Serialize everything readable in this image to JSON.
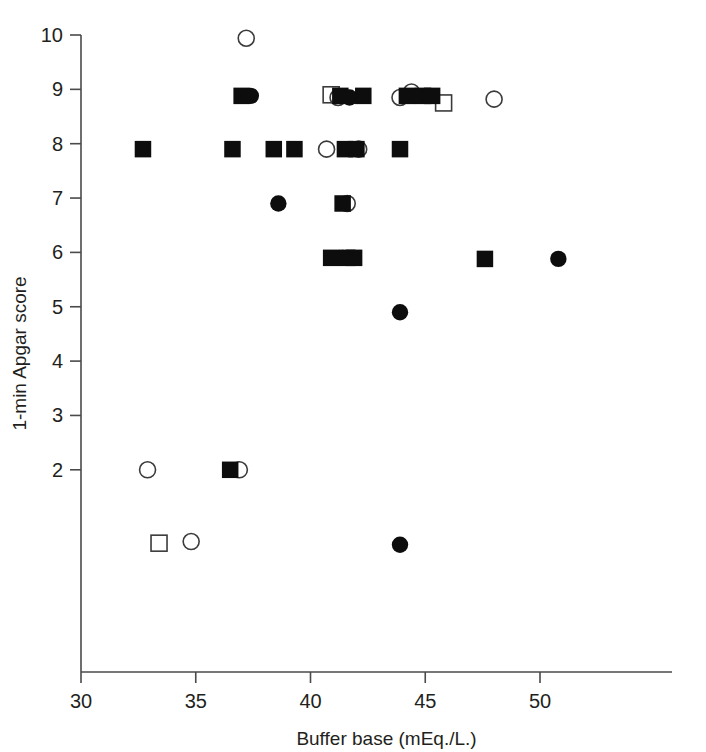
{
  "chart_data": {
    "type": "scatter",
    "title": "",
    "xlabel": "Buffer base (mEq./L.)",
    "ylabel": "1-min Apgar score",
    "xlim": [
      30,
      51.8
    ],
    "ylim": [
      0.55,
      10
    ],
    "grid": false,
    "legend": "none",
    "xticks": [
      30,
      35,
      40,
      45,
      50
    ],
    "xtick_labels": [
      "30",
      "35",
      "40",
      "45",
      "50"
    ],
    "yticks": [
      2,
      3,
      4,
      5,
      6,
      7,
      8,
      9,
      10
    ],
    "ytick_labels": [
      "2",
      "3",
      "4",
      "5",
      "6",
      "7",
      "8",
      "9",
      "10"
    ],
    "marker_types": [
      "filled-square",
      "filled-circle",
      "open-square",
      "open-circle"
    ],
    "series": [
      {
        "name": "filled-square",
        "marker": "filled-square",
        "points": [
          {
            "x": 32.7,
            "y": 7.9
          },
          {
            "x": 36.5,
            "y": 2.0
          },
          {
            "x": 36.6,
            "y": 7.9
          },
          {
            "x": 37.0,
            "y": 8.88
          },
          {
            "x": 38.4,
            "y": 7.9
          },
          {
            "x": 39.3,
            "y": 7.9
          },
          {
            "x": 40.9,
            "y": 5.9
          },
          {
            "x": 41.3,
            "y": 8.88
          },
          {
            "x": 41.4,
            "y": 6.9
          },
          {
            "x": 41.5,
            "y": 7.9
          },
          {
            "x": 41.6,
            "y": 5.9
          },
          {
            "x": 41.9,
            "y": 5.9
          },
          {
            "x": 42.0,
            "y": 7.9
          },
          {
            "x": 42.3,
            "y": 8.88
          },
          {
            "x": 43.9,
            "y": 7.9
          },
          {
            "x": 44.2,
            "y": 8.88
          },
          {
            "x": 44.9,
            "y": 8.88
          },
          {
            "x": 45.3,
            "y": 8.88
          },
          {
            "x": 47.6,
            "y": 5.88
          }
        ]
      },
      {
        "name": "filled-circle",
        "marker": "filled-circle",
        "points": [
          {
            "x": 37.4,
            "y": 8.88
          },
          {
            "x": 38.6,
            "y": 6.9
          },
          {
            "x": 41.4,
            "y": 5.9
          },
          {
            "x": 41.7,
            "y": 8.85
          },
          {
            "x": 43.9,
            "y": 4.9
          },
          {
            "x": 43.9,
            "y": 0.62
          },
          {
            "x": 44.6,
            "y": 8.88
          },
          {
            "x": 50.8,
            "y": 5.88
          }
        ]
      },
      {
        "name": "open-square",
        "marker": "open-square",
        "points": [
          {
            "x": 33.4,
            "y": 0.65
          },
          {
            "x": 40.9,
            "y": 8.9
          },
          {
            "x": 45.8,
            "y": 8.75
          }
        ]
      },
      {
        "name": "open-circle",
        "marker": "open-circle",
        "points": [
          {
            "x": 32.9,
            "y": 2.0
          },
          {
            "x": 34.8,
            "y": 0.68
          },
          {
            "x": 36.9,
            "y": 2.0
          },
          {
            "x": 37.2,
            "y": 9.94
          },
          {
            "x": 40.7,
            "y": 7.9
          },
          {
            "x": 41.2,
            "y": 8.85
          },
          {
            "x": 41.6,
            "y": 6.9
          },
          {
            "x": 42.1,
            "y": 7.9
          },
          {
            "x": 43.9,
            "y": 8.85
          },
          {
            "x": 44.4,
            "y": 8.95
          },
          {
            "x": 48.0,
            "y": 8.82
          }
        ]
      }
    ]
  }
}
